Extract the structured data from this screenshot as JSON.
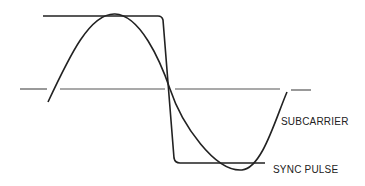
{
  "diagram": {
    "type": "waveform-comparison",
    "labels": {
      "subcarrier": "SUBCARRIER",
      "sync_pulse": "SYNC PULSE"
    },
    "colors": {
      "stroke": "#222222",
      "background": "#ffffff"
    }
  }
}
